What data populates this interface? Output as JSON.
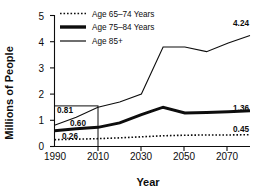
{
  "chart_data": {
    "type": "line",
    "title": "",
    "xlabel": "Year",
    "ylabel": "Millions of People",
    "x": [
      1990,
      2000,
      2010,
      2020,
      2030,
      2040,
      2050,
      2060,
      2070,
      2080
    ],
    "xlim": [
      1990,
      2080
    ],
    "ylim": [
      0,
      5
    ],
    "xticks": [
      "1990",
      "2010",
      "2030",
      "2050",
      "2070"
    ],
    "xtick_values": [
      1990,
      2010,
      2030,
      2050,
      2070
    ],
    "yticks": [
      "0",
      "1",
      "2",
      "3",
      "4",
      "5"
    ],
    "ytick_values": [
      0,
      1,
      2,
      3,
      4,
      5
    ],
    "grid": false,
    "legend_position": "top-left-inside",
    "series": [
      {
        "name": "Age 65–74 Years",
        "style": "dotted",
        "color": "#0d0d0d",
        "width": 1.6,
        "values": [
          0.26,
          0.28,
          0.3,
          0.33,
          0.37,
          0.41,
          0.43,
          0.44,
          0.44,
          0.45
        ]
      },
      {
        "name": "Age 75–84 Years",
        "style": "thick-solid",
        "color": "#0d0d0d",
        "width": 3.0,
        "values": [
          0.6,
          0.68,
          0.73,
          0.9,
          1.22,
          1.5,
          1.28,
          1.3,
          1.33,
          1.36
        ]
      },
      {
        "name": "Age 85+",
        "style": "thin-solid",
        "color": "#0d0d0d",
        "width": 1.1,
        "values": [
          0.81,
          1.12,
          1.5,
          1.7,
          2.0,
          3.8,
          3.8,
          3.62,
          3.95,
          4.24
        ]
      }
    ],
    "annotations": [
      {
        "text": "0.81",
        "x": 1990,
        "y": 0.81,
        "placement": "inside-box-upper"
      },
      {
        "text": "0.60",
        "x": 1998,
        "y": 0.6,
        "placement": "inside-box-middle"
      },
      {
        "text": "0.26",
        "x": 1995,
        "y": 0.26,
        "placement": "inside-box-lower"
      },
      {
        "text": "4.24",
        "x": 2080,
        "y": 4.24,
        "placement": "right-end"
      },
      {
        "text": "1.36",
        "x": 2080,
        "y": 1.36,
        "placement": "right-end"
      },
      {
        "text": "0.45",
        "x": 2080,
        "y": 0.45,
        "placement": "right-end"
      }
    ],
    "callout_box": {
      "x_start": 1990,
      "x_end": 2010,
      "y_top": 1.55,
      "y_bottom": 0
    }
  },
  "legend": {
    "items": [
      {
        "label": "Age 65–74 Years",
        "marker": "dotted-line-swatch"
      },
      {
        "label": "Age 75–84 Years",
        "marker": "thick-line-swatch"
      },
      {
        "label": "Age 85+",
        "marker": "thin-line-swatch"
      }
    ]
  },
  "axes": {
    "y_title": "Millions of People",
    "x_title": "Year"
  }
}
